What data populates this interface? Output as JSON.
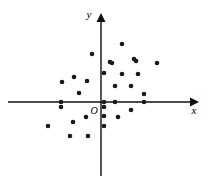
{
  "chart_data": {
    "type": "scatter",
    "title": "",
    "subtitle": "",
    "xlabel": "x",
    "ylabel": "y",
    "origin_label": "O",
    "grid": false,
    "legend": null,
    "axes": {
      "origin_px": [
        101,
        102
      ],
      "x_axis_px": {
        "x1": 8,
        "x2": 196,
        "y": 102
      },
      "y_axis_px": {
        "y1": 16,
        "y2": 176,
        "x": 101
      },
      "arrowheads": [
        "x-positive",
        "y-positive"
      ],
      "xlim": [
        -9.3,
        9.5
      ],
      "ylim": [
        -7.4,
        4.3
      ],
      "units_per_px": 10
    },
    "point_color": "#1a1a1a",
    "point_radius_px": 2.3,
    "n_points": 32,
    "points_px": [
      [
        92,
        54
      ],
      [
        122,
        44
      ],
      [
        136,
        61
      ],
      [
        110,
        62
      ],
      [
        134,
        59
      ],
      [
        112,
        63
      ],
      [
        122,
        74
      ],
      [
        138,
        74
      ],
      [
        104,
        73
      ],
      [
        62,
        82
      ],
      [
        74,
        77
      ],
      [
        87,
        81
      ],
      [
        115,
        86
      ],
      [
        131,
        86
      ],
      [
        144,
        94
      ],
      [
        79,
        93
      ],
      [
        61,
        102
      ],
      [
        104,
        102
      ],
      [
        115,
        102
      ],
      [
        144,
        102
      ],
      [
        104,
        107
      ],
      [
        61,
        107
      ],
      [
        86,
        117
      ],
      [
        104,
        116
      ],
      [
        73,
        122
      ],
      [
        118,
        117
      ],
      [
        48,
        126
      ],
      [
        104,
        126
      ],
      [
        70,
        136
      ],
      [
        88,
        136
      ],
      [
        131,
        110
      ],
      [
        157,
        63
      ]
    ],
    "points_data": [
      [
        -0.9,
        4.8
      ],
      [
        2.1,
        5.8
      ],
      [
        3.5,
        4.1
      ],
      [
        0.9,
        4.0
      ],
      [
        3.3,
        4.3
      ],
      [
        1.1,
        3.9
      ],
      [
        2.1,
        2.8
      ],
      [
        3.7,
        2.8
      ],
      [
        0.3,
        2.9
      ],
      [
        -3.9,
        2.0
      ],
      [
        -2.7,
        2.5
      ],
      [
        -1.4,
        2.1
      ],
      [
        1.4,
        1.6
      ],
      [
        3.0,
        1.6
      ],
      [
        4.3,
        0.8
      ],
      [
        -2.2,
        0.9
      ],
      [
        -4.0,
        0.0
      ],
      [
        0.3,
        0.0
      ],
      [
        1.4,
        0.0
      ],
      [
        4.3,
        0.0
      ],
      [
        0.3,
        -0.5
      ],
      [
        -4.0,
        -0.5
      ],
      [
        -1.5,
        -1.5
      ],
      [
        0.3,
        -1.4
      ],
      [
        -2.8,
        -2.0
      ],
      [
        1.7,
        -1.5
      ],
      [
        -5.3,
        -2.4
      ],
      [
        0.3,
        -2.4
      ],
      [
        -3.1,
        -3.4
      ],
      [
        -1.3,
        -3.4
      ],
      [
        3.0,
        -0.8
      ],
      [
        5.6,
        3.9
      ]
    ]
  }
}
